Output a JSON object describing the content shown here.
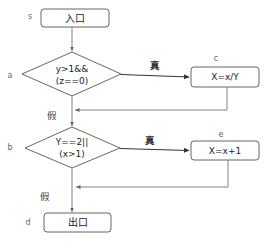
{
  "diagram": {
    "type": "flowchart",
    "nodes": {
      "s": {
        "id_label": "s",
        "text": "入口",
        "shape": "rounded-rect"
      },
      "a": {
        "id_label": "a",
        "line1": "y>1&&",
        "line2": "(z==0)",
        "shape": "diamond"
      },
      "c": {
        "id_label": "c",
        "text": "X=x/Y",
        "shape": "rounded-rect"
      },
      "b": {
        "id_label": "b",
        "line1": "Y==2||",
        "line2": "(x>1)",
        "shape": "diamond"
      },
      "e": {
        "id_label": "e",
        "text": "X=x+1",
        "shape": "rounded-rect"
      },
      "d": {
        "id_label": "d",
        "text": "出口",
        "shape": "rounded-rect"
      }
    },
    "edges": {
      "a_true": {
        "from": "a",
        "to": "c",
        "label": "真"
      },
      "a_false": {
        "from": "a",
        "to": "b",
        "label": "假"
      },
      "c_return": {
        "from": "c",
        "to": "a-b connector",
        "label": ""
      },
      "b_true": {
        "from": "b",
        "to": "e",
        "label": "真"
      },
      "b_false": {
        "from": "b",
        "to": "d",
        "label": "假"
      },
      "e_return": {
        "from": "e",
        "to": "b-d connector",
        "label": ""
      },
      "s_to_a": {
        "from": "s",
        "to": "a",
        "label": ""
      }
    }
  }
}
